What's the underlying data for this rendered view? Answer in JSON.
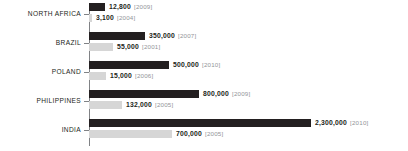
{
  "chart_data": {
    "type": "bar",
    "orientation": "horizontal",
    "title": "",
    "subtitle": "",
    "xlabel": "",
    "ylabel": "",
    "grid": false,
    "legend": "none",
    "axis_position": "left-vertical-line-with-ticks",
    "xlim": [
      0,
      2300000
    ],
    "categories": [
      "NORTH AFRICA",
      "BRAZIL",
      "POLAND",
      "PHILIPPINES",
      "INDIA"
    ],
    "series": [
      {
        "name": "recent",
        "color": "#231f20",
        "values": [
          12800,
          350000,
          500000,
          800000,
          2300000
        ],
        "value_labels": [
          "12,800",
          "350,000",
          "500,000",
          "800,000",
          "2,300,000"
        ],
        "years": [
          "2009",
          "2007",
          "2010",
          "2009",
          "2010"
        ],
        "year_labels": [
          "[2009]",
          "[2007]",
          "[2010]",
          "[2009]",
          "[2010]"
        ]
      },
      {
        "name": "earlier",
        "color": "#d6d6d6",
        "values": [
          3100,
          55000,
          15000,
          132000,
          700000
        ],
        "value_labels": [
          "3,100",
          "55,000",
          "15,000",
          "132,000",
          "700,000"
        ],
        "years": [
          "2004",
          "2001",
          "2006",
          "2005",
          "2005"
        ],
        "year_labels": [
          "[2004]",
          "[2001]",
          "[2006]",
          "[2005]",
          "[2005]"
        ]
      }
    ],
    "rows": [
      {
        "category": "NORTH AFRICA",
        "primary": {
          "value_label": "12,800",
          "year_label": "[2009]",
          "bar_px": 16
        },
        "secondary": {
          "value_label": "3,100",
          "year_label": "[2004]",
          "bar_px": 3
        }
      },
      {
        "category": "BRAZIL",
        "primary": {
          "value_label": "350,000",
          "year_label": "[2007]",
          "bar_px": 56
        },
        "secondary": {
          "value_label": "55,000",
          "year_label": "[2001]",
          "bar_px": 24
        }
      },
      {
        "category": "POLAND",
        "primary": {
          "value_label": "500,000",
          "year_label": "[2010]",
          "bar_px": 80
        },
        "secondary": {
          "value_label": "15,000",
          "year_label": "[2006]",
          "bar_px": 17
        }
      },
      {
        "category": "PHILIPPINES",
        "primary": {
          "value_label": "800,000",
          "year_label": "[2009]",
          "bar_px": 110
        },
        "secondary": {
          "value_label": "132,000",
          "year_label": "[2005]",
          "bar_px": 33
        }
      },
      {
        "category": "INDIA",
        "primary": {
          "value_label": "2,300,000",
          "year_label": "[2010]",
          "bar_px": 222
        },
        "secondary": {
          "value_label": "700,000",
          "year_label": "[2005]",
          "bar_px": 83
        }
      }
    ]
  },
  "colors": {
    "primary_bar": "#231f20",
    "secondary_bar": "#d6d6d6",
    "axis": "#808285",
    "value_text": "#231f20",
    "year_text": "#939598",
    "background": "#ffffff"
  }
}
